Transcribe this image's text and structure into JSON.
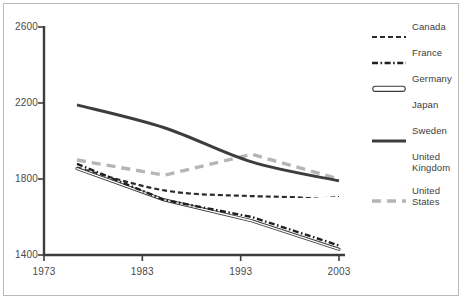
{
  "chart_data": {
    "type": "line",
    "title": "",
    "xlabel": "",
    "ylabel": "",
    "x": [
      1973,
      1983,
      1993,
      2003
    ],
    "xlim": [
      1973,
      2003
    ],
    "ylim": [
      1400,
      2600
    ],
    "xticks": [
      "1973",
      "1983",
      "1993",
      "2003"
    ],
    "yticks": [
      "1400",
      "1800",
      "2200",
      "2600"
    ],
    "grid": false,
    "legend_position": "right",
    "series": [
      {
        "name": "Canada",
        "style": "dashed",
        "color": "#2b2b2b",
        "width": 2.2,
        "values": [
          1860,
          1740,
          1710,
          1705
        ]
      },
      {
        "name": "France",
        "style": "dash-dot",
        "color": "#1f1f1f",
        "width": 2.4,
        "values": [
          1880,
          1690,
          1600,
          1450
        ]
      },
      {
        "name": "Germany",
        "style": "outline",
        "color": "#3a3a3a",
        "width": 3.2,
        "values": [
          1855,
          1690,
          1580,
          1430
        ]
      },
      {
        "name": "Japan",
        "style": "none",
        "color": "#ffffff",
        "width": 2.0,
        "values": [
          1855,
          1700,
          1585,
          1440
        ]
      },
      {
        "name": "Sweden",
        "style": "solid",
        "color": "#3d3d3d",
        "width": 3.0,
        "values": [
          2190,
          2070,
          1890,
          1790
        ]
      },
      {
        "name": "United Kingdom",
        "style": "none",
        "color": "#ffffff",
        "width": 2.0,
        "values": [
          1880,
          1760,
          1730,
          1700
        ]
      },
      {
        "name": "United States",
        "style": "long-dash",
        "color": "#b5b5b5",
        "width": 3.4,
        "values": [
          1900,
          1820,
          1930,
          1800
        ]
      }
    ]
  },
  "axes": {
    "y_ticks": [
      {
        "label": "2600",
        "value": 2600
      },
      {
        "label": "2200",
        "value": 2200
      },
      {
        "label": "1800",
        "value": 1800
      },
      {
        "label": "1400",
        "value": 1400
      }
    ],
    "x_ticks": [
      {
        "label": "1973",
        "value": 1973
      },
      {
        "label": "1983",
        "value": 1983
      },
      {
        "label": "1993",
        "value": 1993
      },
      {
        "label": "2003",
        "value": 2003
      }
    ]
  },
  "legend": {
    "items": [
      {
        "label": "Canada",
        "swatch": "canada-dashed-swatch"
      },
      {
        "label": "France",
        "swatch": "france-dashdot-swatch"
      },
      {
        "label": "Germany",
        "swatch": "germany-outline-swatch"
      },
      {
        "label": "Japan",
        "swatch": "japan-blank-swatch"
      },
      {
        "label": "Sweden",
        "swatch": "sweden-solid-swatch"
      },
      {
        "label": "United\nKingdom",
        "swatch": "uk-blank-swatch"
      },
      {
        "label": "United\nStates",
        "swatch": "us-dashed-swatch"
      }
    ]
  },
  "colors": {
    "frame_border": "#b9b9b9",
    "axis": "#3d3d3d",
    "tick_text": "#4a4a4a",
    "background": "#ffffff"
  }
}
